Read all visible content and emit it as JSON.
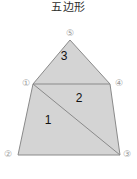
{
  "figure": {
    "title": "五边形",
    "caption": "",
    "shape_name": "pentagon",
    "fill_color": "#d4d4d4",
    "stroke_color": "#8a8a8a",
    "divider_color": "#8a8a8a",
    "background_color": "#ffffff",
    "label_color": "#111111",
    "vertex_label_color": "#9a9a9a"
  },
  "pentagon": {
    "outline_points": "33,84 70,40 110,84 120,155 18,155",
    "vertices": [
      {
        "id": "1",
        "label": "①",
        "x": 33,
        "y": 84,
        "label_x": 20,
        "label_y": 78
      },
      {
        "id": "2",
        "label": "②",
        "x": 18,
        "y": 155,
        "label_x": 3,
        "label_y": 150
      },
      {
        "id": "3",
        "label": "③",
        "x": 120,
        "y": 155,
        "label_x": 121,
        "label_y": 150
      },
      {
        "id": "4",
        "label": "④",
        "x": 110,
        "y": 84,
        "label_x": 114,
        "label_y": 78
      },
      {
        "id": "5",
        "label": "⑤",
        "x": 70,
        "y": 40,
        "label_x": 64,
        "label_y": 28
      }
    ],
    "dividers": [
      {
        "name": "divider-1-4",
        "x1": 33,
        "y1": 84,
        "x2": 110,
        "y2": 84
      },
      {
        "name": "divider-1-3",
        "x1": 33,
        "y1": 84,
        "x2": 120,
        "y2": 155
      }
    ],
    "regions": [
      {
        "id": "1",
        "label": "1",
        "label_x": 48,
        "label_y": 120,
        "polygon": "33,84 120,155 18,155"
      },
      {
        "id": "2",
        "label": "2",
        "label_x": 79,
        "label_y": 98,
        "polygon": "33,84 110,84 120,155"
      },
      {
        "id": "3",
        "label": "3",
        "label_x": 64,
        "label_y": 56,
        "polygon": "33,84 70,40 110,84"
      }
    ]
  }
}
